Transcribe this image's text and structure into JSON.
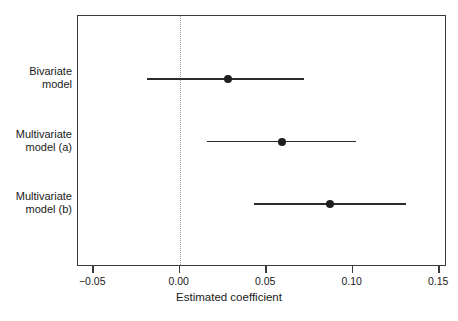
{
  "chart_data": {
    "type": "scatter",
    "subtype": "forest-plot",
    "title": "",
    "xlabel": "Estimated coefficient",
    "ylabel": "",
    "xlim": [
      -0.0588,
      0.1545
    ],
    "xticks": [
      -0.05,
      0.0,
      0.05,
      0.1,
      0.15
    ],
    "xticklabels": [
      "−0.05",
      "0.00",
      "0.05",
      "0.10",
      "0.15"
    ],
    "grid": false,
    "legend": null,
    "reference_line": {
      "x": 0.0,
      "style": "dotted",
      "color": "#9a9a9a"
    },
    "categories": [
      "Bivariate model",
      "Multivariate model (a)",
      "Multivariate model (b)"
    ],
    "points": [
      {
        "label_line1": "Bivariate",
        "label_line2": "model",
        "estimate": 0.028,
        "ci_low": -0.019,
        "ci_high": 0.072
      },
      {
        "label_line1": "Multivariate",
        "label_line2": "model (a)",
        "estimate": 0.059,
        "ci_low": 0.016,
        "ci_high": 0.102
      },
      {
        "label_line1": "Multivariate",
        "label_line2": "model (b)",
        "estimate": 0.087,
        "ci_low": 0.043,
        "ci_high": 0.131
      }
    ],
    "colors": {
      "marker": "#1f1f1f",
      "line": "#2b2b2b",
      "axis": "#3a3a3a",
      "reference": "#9a9a9a",
      "background": "#ffffff"
    }
  }
}
